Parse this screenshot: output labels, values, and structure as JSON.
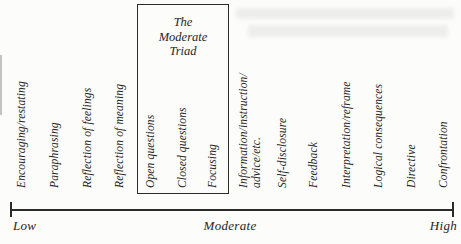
{
  "triad": {
    "title_lines": [
      "The",
      "Moderate",
      "Triad"
    ]
  },
  "skills": [
    "Encouraging/restating",
    "Paraphrasing",
    "Reflection of feelings",
    "Reflection of meaning",
    "Open questions",
    "Closed questions",
    "Focusing",
    "Information/instruction/",
    "advice/etc.",
    "Self-disclosure",
    "Feedback",
    "Interpretation/reframe",
    "Logical consequences",
    "Directive",
    "Confrontation"
  ],
  "axis": {
    "low": "Low",
    "moderate": "Moderate",
    "high": "High"
  },
  "colors": {
    "ink": "#2b2b2b",
    "paper": "#fcfcfa"
  }
}
